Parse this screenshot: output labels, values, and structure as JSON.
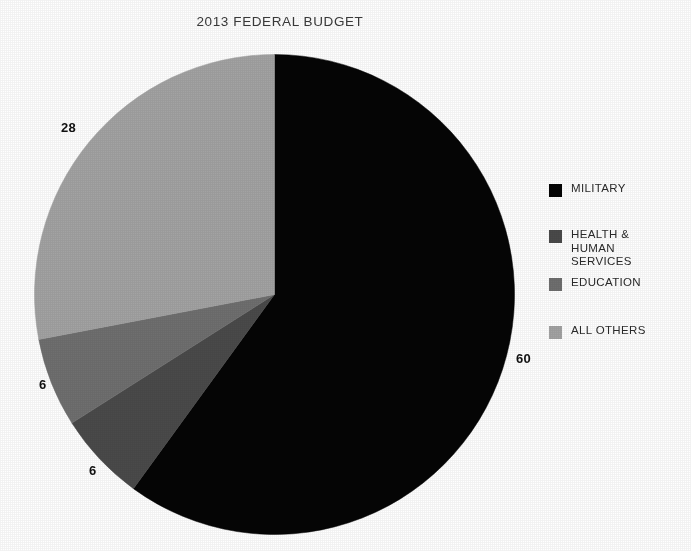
{
  "chart_data": {
    "type": "pie",
    "title": "2013 FEDERAL BUDGET",
    "subtitle": "",
    "xlabel": "",
    "ylabel": "",
    "grid": false,
    "legend_position": "right",
    "units": "percent",
    "total": 100,
    "start_angle_deg": 0,
    "direction": "clockwise",
    "categories": [
      "MILITARY",
      "HEALTH & HUMAN SERVICES",
      "EDUCATION",
      "ALL OTHERS"
    ],
    "values": [
      60,
      6,
      6,
      28
    ],
    "colors": [
      "#050505",
      "#4a4a4a",
      "#6f6f6f",
      "#a3a3a3"
    ],
    "data_labels": [
      "60",
      "6",
      "6",
      "28"
    ],
    "slices": [
      {
        "label": "MILITARY",
        "value": 60,
        "data_label": "60",
        "color": "#050505"
      },
      {
        "label": "HEALTH & HUMAN SERVICES",
        "value": 6,
        "data_label": "6",
        "color": "#4a4a4a"
      },
      {
        "label": "EDUCATION",
        "value": 6,
        "data_label": "6",
        "color": "#6f6f6f"
      },
      {
        "label": "ALL OTHERS",
        "value": 28,
        "data_label": "28",
        "color": "#a3a3a3"
      }
    ]
  },
  "title": {
    "text": "2013 FEDERAL BUDGET"
  },
  "value_labels": {
    "all_others": "28",
    "military": "60",
    "education": "6",
    "health_human_services": "6"
  },
  "legend": {
    "items": [
      {
        "label": "MILITARY",
        "color": "#050505"
      },
      {
        "label": "HEALTH &\nHUMAN\nSERVICES",
        "color": "#4a4a4a"
      },
      {
        "label": "EDUCATION",
        "color": "#6f6f6f"
      },
      {
        "label": "ALL OTHERS",
        "color": "#a3a3a3"
      }
    ]
  }
}
